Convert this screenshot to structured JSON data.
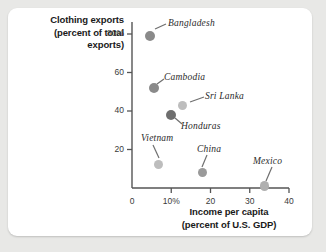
{
  "chart_data": {
    "type": "scatter",
    "title": "",
    "xlabel": "Income per capita (percent of U.S. GDP)",
    "xlabel_line1": "Income per capita",
    "xlabel_line2": "(percent of U.S. GDP)",
    "ylabel": "Clothing exports (percent of total exports)",
    "ylabel_line1": "Clothing exports",
    "ylabel_line2": "(percent of total",
    "ylabel_line3": "exports)",
    "xlim": [
      0,
      40
    ],
    "ylim": [
      0,
      88
    ],
    "grid": false,
    "legend": "none",
    "xticks": [
      {
        "value": 0,
        "label": "0"
      },
      {
        "value": 10,
        "label": "10%"
      },
      {
        "value": 20,
        "label": "20"
      },
      {
        "value": 30,
        "label": "30"
      },
      {
        "value": 40,
        "label": "40"
      }
    ],
    "yticks": [
      {
        "value": 20,
        "label": "20"
      },
      {
        "value": 40,
        "label": "40"
      },
      {
        "value": 60,
        "label": "60"
      },
      {
        "value": 80,
        "label": "80%"
      }
    ],
    "points": [
      {
        "name": "Bangladesh",
        "x": 4.5,
        "y": 79,
        "color": "#8a8a8a",
        "r": 5.0,
        "label_x": 168,
        "label_y": 18,
        "lead": [
          155,
          29,
          166,
          24
        ]
      },
      {
        "name": "Cambodia",
        "x": 5.5,
        "y": 52,
        "color": "#8a8a8a",
        "r": 5.0,
        "label_x": 164,
        "label_y": 72,
        "lead": [
          157,
          84,
          164,
          79
        ]
      },
      {
        "name": "Sri Lanka",
        "x": 12.8,
        "y": 43,
        "color": "#bdbdbd",
        "r": 4.6,
        "label_x": 205,
        "label_y": 91,
        "lead": [
          190,
          102,
          204,
          97
        ]
      },
      {
        "name": "Honduras",
        "x": 10.0,
        "y": 38,
        "color": "#6e6e6e",
        "r": 5.0,
        "label_x": 181,
        "label_y": 121,
        "lead": [
          175,
          118,
          182,
          124
        ]
      },
      {
        "name": "Vietnam",
        "x": 6.7,
        "y": 12,
        "color": "#bdbdbd",
        "r": 4.6,
        "label_x": 141,
        "label_y": 133,
        "lead": [
          159,
          158,
          153,
          145
        ]
      },
      {
        "name": "China",
        "x": 18.0,
        "y": 8,
        "color": "#9a9a9a",
        "r": 4.8,
        "label_x": 197,
        "label_y": 144,
        "lead": [
          202,
          167,
          207,
          155
        ]
      },
      {
        "name": "Mexico",
        "x": 33.8,
        "y": 1,
        "color": "#b0b0b0",
        "r": 4.8,
        "label_x": 253,
        "label_y": 156,
        "lead": [
          266,
          181,
          272,
          167
        ]
      }
    ],
    "axis_geometry": {
      "x0_px": 132,
      "x40_px": 289,
      "y0_px": 188,
      "y80_px": 34
    }
  }
}
